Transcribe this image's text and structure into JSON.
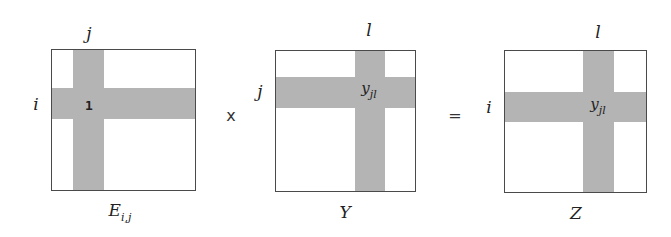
{
  "diagram": {
    "type": "matrix-multiplication",
    "bar_color": "#b4b4b4",
    "border_color": "#4a4a4a",
    "operators": {
      "multiply": "x",
      "equals": "="
    },
    "matrices": [
      {
        "name": "E",
        "label": "E",
        "label_sub": "i,j",
        "row_label": "i",
        "col_label": "j",
        "entry": "1",
        "entry_sub": ""
      },
      {
        "name": "Y",
        "label": "Y",
        "label_sub": "",
        "row_label": "j",
        "col_label": "l",
        "entry": "y",
        "entry_sub": "jl"
      },
      {
        "name": "Z",
        "label": "Z",
        "label_sub": "",
        "row_label": "i",
        "col_label": "l",
        "entry": "y",
        "entry_sub": "jl"
      }
    ]
  }
}
